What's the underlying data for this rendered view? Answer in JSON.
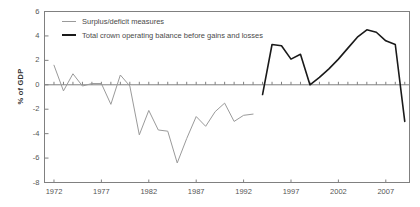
{
  "chart_data": {
    "type": "line",
    "title": "",
    "xlabel": "",
    "ylabel": "% of GDP",
    "xlim": [
      1971,
      2009.5
    ],
    "ylim": [
      -8,
      6
    ],
    "ytick_labels": [
      "6",
      "4",
      "2",
      "0",
      "-2",
      "-4",
      "-6",
      "-8"
    ],
    "yticks": [
      6,
      4,
      2,
      0,
      -2,
      -4,
      -6,
      -8
    ],
    "xtick_labels": [
      "1972",
      "1977",
      "1982",
      "1987",
      "1992",
      "1997",
      "2002",
      "2007"
    ],
    "xticks": [
      1972,
      1977,
      1982,
      1987,
      1992,
      1997,
      2002,
      2007
    ],
    "grid": false,
    "legend_position": "top-left-inside",
    "colors": {
      "surplus_deficit": "#9a9a9a",
      "crown_balance": "#1a1a1a",
      "axis": "#808080",
      "text": "#4a4a4a"
    },
    "series": [
      {
        "name": "Surplus/deficit measures",
        "color": "#9a9a9a",
        "x": [
          1972,
          1973,
          1974,
          1975,
          1976,
          1977,
          1978,
          1979,
          1980,
          1981,
          1982,
          1983,
          1984,
          1985,
          1986,
          1987,
          1988,
          1989,
          1990,
          1991,
          1992,
          1993
        ],
        "values": [
          1.6,
          -0.5,
          0.9,
          -0.1,
          0.1,
          0.1,
          -1.6,
          0.8,
          -0.1,
          -4.1,
          -2.1,
          -3.7,
          -3.8,
          -6.4,
          -4.4,
          -2.6,
          -3.4,
          -2.2,
          -1.5,
          -3.0,
          -2.5,
          -2.4
        ]
      },
      {
        "name": "Total crown operating balance before gains and losses",
        "color": "#1a1a1a",
        "x": [
          1994,
          1995,
          1996,
          1997,
          1998,
          1999,
          2000,
          2001,
          2002,
          2003,
          2004,
          2005,
          2006,
          2007,
          2008,
          2009
        ],
        "values": [
          -0.8,
          3.3,
          3.2,
          2.1,
          2.5,
          0.0,
          0.6,
          1.3,
          2.1,
          3.0,
          3.9,
          4.5,
          4.3,
          3.6,
          3.3,
          -3.0
        ]
      }
    ]
  },
  "legend": {
    "items": [
      {
        "label": "Surplus/deficit measures"
      },
      {
        "label": "Total crown operating balance before gains and losses"
      }
    ]
  }
}
